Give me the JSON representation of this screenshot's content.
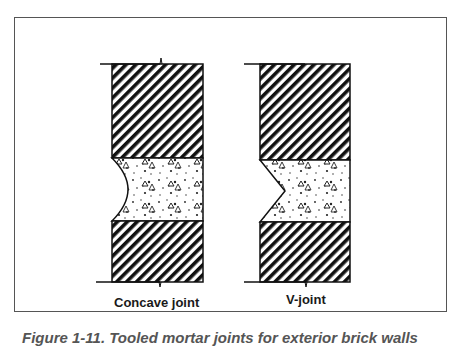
{
  "figure": {
    "labels": {
      "concave": "Concave joint",
      "vjoint": "V-joint"
    },
    "caption": "Figure 1-11. Tooled mortar joints for exterior brick walls"
  },
  "diagram": {
    "type": "brick-and-mortar joint sections",
    "panels": [
      {
        "name": "concave-joint",
        "joint_profile": "concave",
        "upper_brick": "hatched masonry",
        "mortar": "stippled aggregate",
        "lower_brick": "hatched masonry"
      },
      {
        "name": "v-joint",
        "joint_profile": "v-notch",
        "upper_brick": "hatched masonry",
        "mortar": "stippled aggregate",
        "lower_brick": "hatched masonry"
      }
    ],
    "colors": {
      "ink": "#111111",
      "frame": "#555555",
      "background": "#ffffff"
    }
  }
}
